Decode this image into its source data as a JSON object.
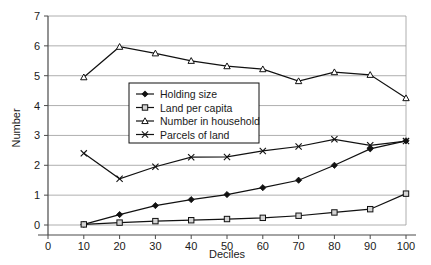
{
  "chart_data": {
    "type": "line",
    "title": "",
    "xlabel": "Deciles",
    "ylabel": "Number",
    "xlim": [
      0,
      100
    ],
    "ylim": [
      0,
      7
    ],
    "grid": true,
    "legend_position": "inside-upper-left",
    "x_ticks": [
      "0",
      "10",
      "20",
      "30",
      "40",
      "50",
      "60",
      "70",
      "80",
      "90",
      "100"
    ],
    "y_ticks": [
      "0",
      "1",
      "2",
      "3",
      "4",
      "5",
      "6",
      "7"
    ],
    "x": [
      10,
      20,
      30,
      40,
      50,
      60,
      70,
      80,
      90,
      100
    ],
    "series": [
      {
        "name": "Holding size",
        "marker": "filled-diamond",
        "values": [
          0.02,
          0.35,
          0.65,
          0.85,
          1.02,
          1.25,
          1.5,
          2.0,
          2.55,
          2.82
        ]
      },
      {
        "name": "Land per capita",
        "marker": "open-square",
        "values": [
          0.02,
          0.08,
          0.13,
          0.16,
          0.2,
          0.24,
          0.31,
          0.42,
          0.53,
          1.05
        ]
      },
      {
        "name": "Number in household",
        "marker": "open-triangle",
        "values": [
          4.95,
          5.97,
          5.75,
          5.5,
          5.32,
          5.22,
          4.82,
          5.12,
          5.03,
          4.25
        ]
      },
      {
        "name": "Parcels of land",
        "marker": "cross-x",
        "values": [
          2.4,
          1.55,
          1.95,
          2.27,
          2.28,
          2.48,
          2.63,
          2.87,
          2.67,
          2.81
        ]
      }
    ]
  },
  "colors": {
    "line": "#111111",
    "grid": "#9a9a9a",
    "axis": "#4a4a4a",
    "marker_fill": "#d4d4d4",
    "background": "#ffffff"
  }
}
